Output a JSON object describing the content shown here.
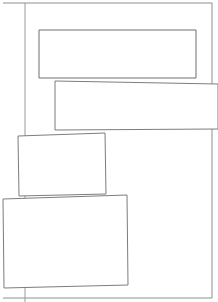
{
  "page": {
    "width": 218,
    "height": 302,
    "background_color": "#ffffff",
    "line_color": "#6f6f6f",
    "frame_color": "#8e8e8e",
    "rule_color": "#9a9a9a"
  },
  "frame": {
    "name": "page-border",
    "points": "3,3 212,3 212,298 3,298",
    "description": "outer page border"
  },
  "vertical_rule": {
    "name": "left-vertical-rule",
    "x": 25,
    "y_start": 3,
    "y_end": 302,
    "description": "thin vertical guide line near left margin"
  },
  "panels": [
    {
      "id": "panel-1",
      "label": "top-panel",
      "points": "39,30 196,30 196,78 39,78",
      "rotation": 0,
      "order": 1
    },
    {
      "id": "panel-2",
      "label": "upper-right-panel",
      "points": "55,81 218,84 218,129 55,130",
      "rotation": 0.9,
      "order": 2
    },
    {
      "id": "panel-3",
      "label": "middle-left-panel",
      "points": "18,136 105,133 106,194 19,196",
      "rotation": -1.8,
      "order": 3
    },
    {
      "id": "panel-4",
      "label": "bottom-panel",
      "points": "3,199 127,195 128,285 4,288",
      "rotation": -1.6,
      "order": 4
    }
  ]
}
